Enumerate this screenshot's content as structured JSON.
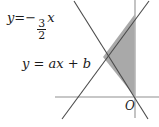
{
  "figure": {
    "type": "coordinate-geometry-diagram",
    "background_color": "#ffffff",
    "axis_color": "#b5b5b5",
    "line_color": "#4a4a4a",
    "shade_color": "#a9a9a9",
    "text_color": "#1a1a1a",
    "width": 159,
    "height": 127,
    "origin": {
      "x": 135,
      "y": 97,
      "label": "O"
    },
    "axes": {
      "x_axis": {
        "x1": 55,
        "y1": 97,
        "x2": 159,
        "y2": 97
      },
      "y_axis": {
        "x1": 135,
        "y1": 0,
        "x2": 135,
        "y2": 118
      }
    },
    "lines": [
      {
        "name": "descending-line",
        "equation": "y = -3/2 x",
        "slope": -1.5,
        "intercept": 0,
        "x1": 74,
        "y1": 1,
        "x2": 148,
        "y2": 119
      },
      {
        "name": "ascending-line",
        "equation": "y = ax + b",
        "slope": "a",
        "intercept": "b",
        "x1": 62,
        "y1": 119,
        "x2": 149,
        "y2": 1
      }
    ],
    "shaded_region": {
      "name": "shaded-triangle",
      "fill": "#a9a9a9",
      "vertices": [
        {
          "x": 103,
          "y": 57
        },
        {
          "x": 135,
          "y": 14
        },
        {
          "x": 135,
          "y": 97
        }
      ]
    }
  },
  "labels": {
    "equation_slope": {
      "lhs": "y",
      "equals": "=",
      "minus": "−",
      "numerator": "3",
      "denominator": "2",
      "variable": "x",
      "full_text": "y = -3/2 x"
    },
    "equation_general": {
      "text": "y = ax + b"
    },
    "origin": {
      "text": "O"
    }
  }
}
